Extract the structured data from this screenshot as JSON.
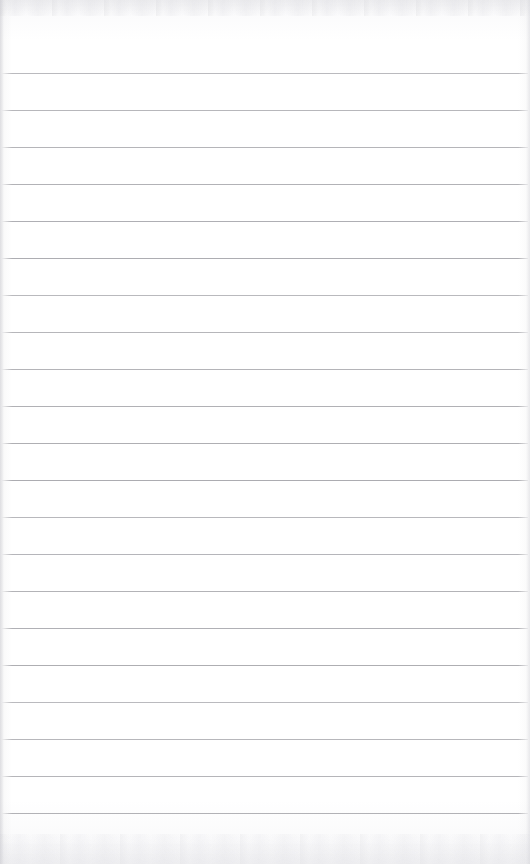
{
  "document": {
    "kind": "scanned-ruled-notepad-page",
    "title": "Ruled Notepad Page",
    "content_text": "",
    "handwriting_present": "no",
    "printed_text_present": "no"
  },
  "page": {
    "width_px": 530,
    "height_px": 864,
    "paper_color": "#ffffff",
    "rule_color": "#a9a9ae",
    "scan_edge_color": "#f2f2f4"
  },
  "ruling": {
    "line_count": 21,
    "first_line_y_px": 73,
    "line_spacing_px": 37,
    "line_thickness_px": 1,
    "line_left_x_px": 2,
    "line_right_x_px": 528,
    "margin_rule_present": "no",
    "line_y_positions_px": [
      73,
      110,
      147,
      184,
      221,
      258,
      295,
      332,
      369,
      406,
      443,
      480,
      517,
      554,
      591,
      628,
      665,
      702,
      739,
      776,
      813
    ]
  },
  "artifacts": {
    "top_band_label": "scan noise band",
    "bottom_band_label": "scan noise band",
    "left_edge_label": "scan edge shadow",
    "right_edge_label": "scan edge shadow"
  }
}
